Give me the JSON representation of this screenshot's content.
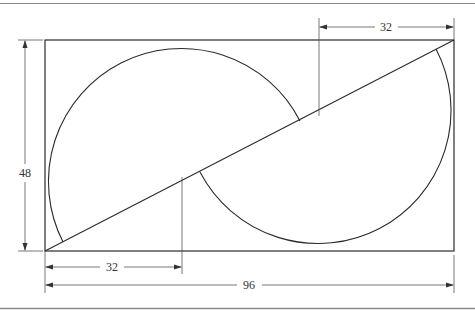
{
  "diagram": {
    "type": "technical-drawing",
    "colors": {
      "line": "#2a2a2a",
      "dim": "#555555",
      "border": "#8a8a8a",
      "text": "#333333"
    },
    "rectangle": {
      "width_label": "96",
      "height_label": "48"
    },
    "dimensions": {
      "height": "48",
      "top_offset": "32",
      "bottom_offset": "32",
      "total_width": "96"
    }
  }
}
